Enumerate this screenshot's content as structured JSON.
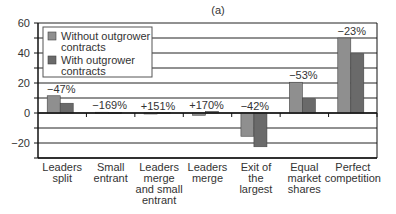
{
  "chart_data": {
    "type": "bar",
    "title": "(a)",
    "xlabel": "",
    "ylabel": "",
    "ylim": [
      -30,
      60
    ],
    "yticks": [
      -20,
      0,
      20,
      40,
      60
    ],
    "grid": true,
    "gridline_step": 10,
    "legend_position": "upper-left inside",
    "categories": [
      [
        "Leaders",
        "split"
      ],
      [
        "Small",
        "entrant"
      ],
      [
        "Leaders",
        "merge",
        "and small",
        "entrant"
      ],
      [
        "Leaders",
        "merge"
      ],
      [
        "Exit of",
        "the",
        "largest"
      ],
      [
        "Equal",
        "market",
        "shares"
      ],
      [
        "Perfect",
        "competition"
      ]
    ],
    "series": [
      {
        "name": "Without outgrower contracts",
        "color": "#8f8f8f",
        "values": [
          11.5,
          0.5,
          -0.5,
          -1.5,
          -15.5,
          20.5,
          50
        ]
      },
      {
        "name": "With outgrower contracts",
        "color": "#6a6a6a",
        "values": [
          6.5,
          0.3,
          0.3,
          1,
          -22.5,
          9.5,
          39.5
        ]
      }
    ],
    "annotations": [
      "−47%",
      "−169%",
      "+151%",
      "+170%",
      "−42%",
      "−53%",
      "−23%"
    ]
  },
  "legend": {
    "items": [
      {
        "lines": [
          "Without outgrower",
          "contracts"
        ]
      },
      {
        "lines": [
          "With outgrower",
          "contracts"
        ]
      }
    ]
  }
}
